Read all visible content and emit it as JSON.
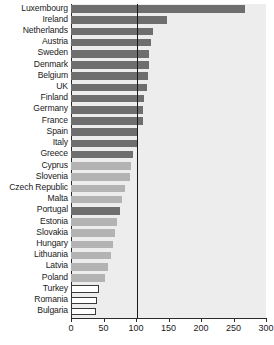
{
  "chart_data": {
    "type": "bar",
    "orientation": "horizontal",
    "title": "",
    "subtitle": "",
    "xlabel": "",
    "ylabel": "",
    "xlim": [
      0,
      300
    ],
    "xticks": [
      0,
      50,
      100,
      150,
      200,
      250,
      300
    ],
    "xtick_labels": [
      "0",
      "50",
      "100",
      "150",
      "200",
      "250",
      "300"
    ],
    "grid": false,
    "legend": null,
    "reference_line": {
      "value": 100,
      "label": "100",
      "color": "#1a1a1a"
    },
    "background_color": "#ededed",
    "series_colors": {
      "member_state": "#6e6e6e",
      "new_member_state": "#b3b3b3",
      "candidate_country": "#ffffff"
    },
    "categories": [
      "Luxembourg",
      "Ireland",
      "Netherlands",
      "Austria",
      "Sweden",
      "Denmark",
      "Belgium",
      "UK",
      "Finland",
      "Germany",
      "France",
      "Spain",
      "Italy",
      "Greece",
      "Cyprus",
      "Slovenia",
      "Czech Republic",
      "Malta",
      "Portugal",
      "Estonia",
      "Slovakia",
      "Hungary",
      "Lithuania",
      "Latvia",
      "Poland",
      "Turkey",
      "Romania",
      "Bulgaria"
    ],
    "values": [
      268,
      148,
      126,
      123,
      120,
      120,
      118,
      117,
      113,
      111,
      110,
      101,
      101,
      96,
      93,
      90,
      83,
      79,
      76,
      70,
      68,
      64,
      61,
      57,
      53,
      43,
      40,
      38
    ],
    "groups": [
      "member_state",
      "member_state",
      "member_state",
      "member_state",
      "member_state",
      "member_state",
      "member_state",
      "member_state",
      "member_state",
      "member_state",
      "member_state",
      "member_state",
      "member_state",
      "member_state",
      "new_member_state",
      "new_member_state",
      "new_member_state",
      "new_member_state",
      "member_state",
      "new_member_state",
      "new_member_state",
      "new_member_state",
      "new_member_state",
      "new_member_state",
      "new_member_state",
      "candidate_country",
      "candidate_country",
      "candidate_country"
    ]
  }
}
